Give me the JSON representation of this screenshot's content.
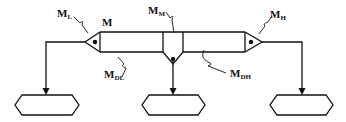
{
  "diagram": {
    "type": "mixer-flow-schematic",
    "labels": {
      "m": "M",
      "ml": {
        "main": "M",
        "sub": "L"
      },
      "mm": {
        "main": "M",
        "sub": "M"
      },
      "mh": {
        "main": "M",
        "sub": "H"
      },
      "mdl": {
        "main": "M",
        "sub": "DL"
      },
      "mdh": {
        "main": "M",
        "sub": "DH"
      }
    },
    "nodes": [
      {
        "id": "output-left",
        "shape": "hexagon",
        "label": ""
      },
      {
        "id": "output-center",
        "shape": "hexagon",
        "label": ""
      },
      {
        "id": "output-right",
        "shape": "hexagon",
        "label": ""
      }
    ],
    "components": [
      {
        "id": "left-nozzle",
        "label_ref": "ml"
      },
      {
        "id": "center-nozzle",
        "label_ref": "mm"
      },
      {
        "id": "right-nozzle",
        "label_ref": "mh"
      },
      {
        "id": "left-chamber",
        "label_ref": "mdl"
      },
      {
        "id": "right-chamber",
        "label_ref": "mdh"
      },
      {
        "id": "main-body",
        "label_ref": "m"
      }
    ],
    "colors": {
      "ink": "#111111",
      "background": "#ffffff"
    }
  }
}
